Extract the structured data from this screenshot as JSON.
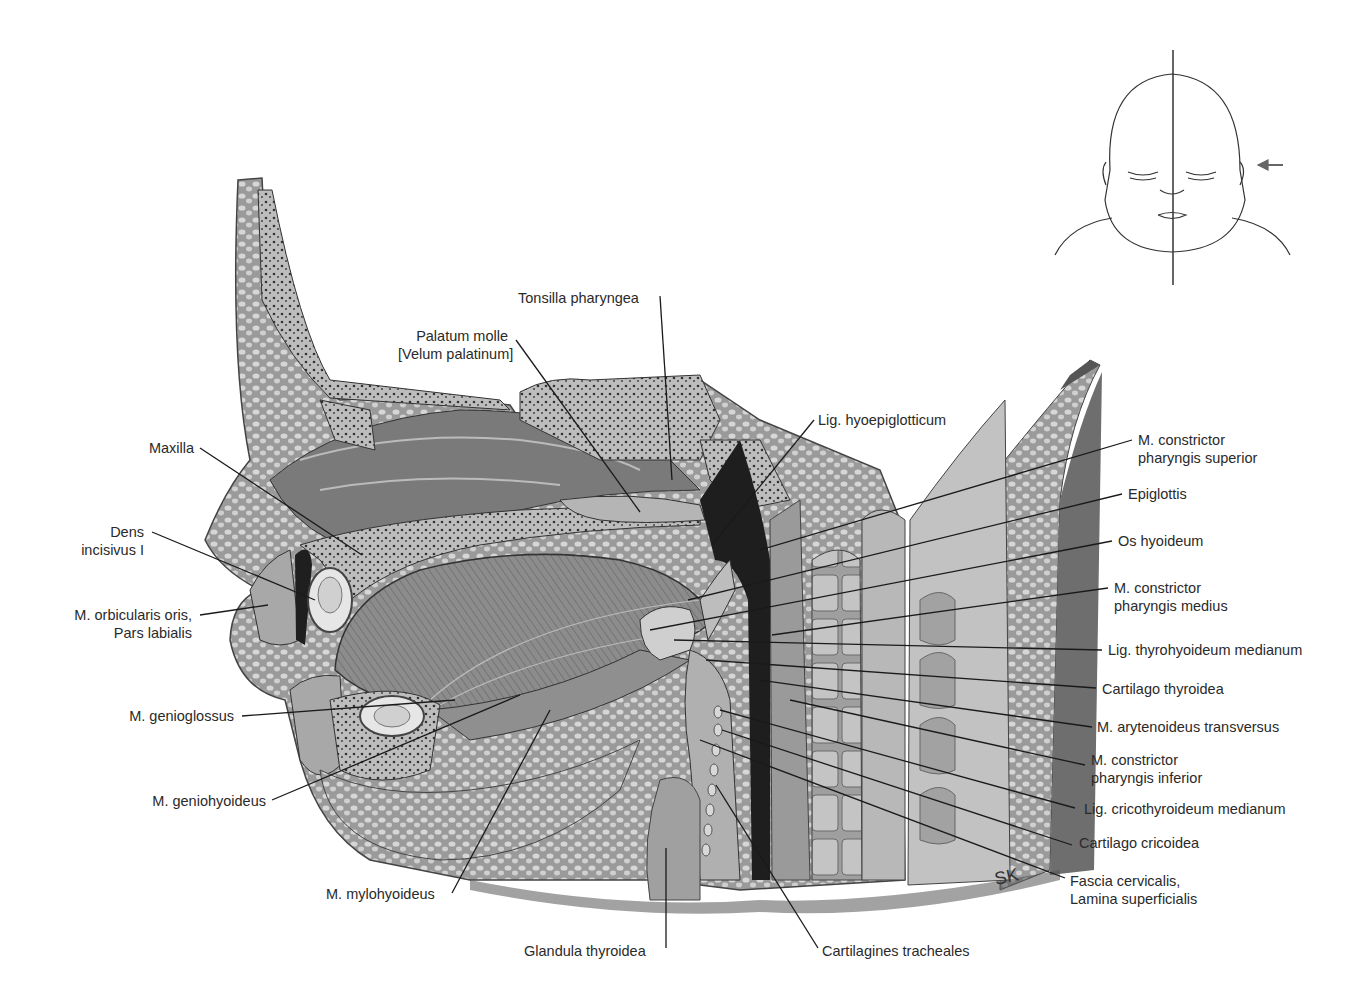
{
  "figure": {
    "signature": "SK",
    "orientation_inset": {
      "icon": "infant-face-with-midline-and-arrow"
    }
  },
  "labels": {
    "tonsilla_pharyngea": "Tonsilla pharyngea",
    "palatum_molle_1": "Palatum molle",
    "palatum_molle_2": "[Velum palatinum]",
    "lig_hyoepiglotticum": "Lig. hyoepiglotticum",
    "maxilla": "Maxilla",
    "dens_1": "Dens",
    "dens_2": "incisivus I",
    "orbicularis_1": "M. orbicularis oris,",
    "orbicularis_2": "Pars labialis",
    "genioglossus": "M. genioglossus",
    "geniohyoideus": "M. geniohyoideus",
    "mylohyoideus": "M. mylohyoideus",
    "glandula_thyroidea": "Glandula thyroidea",
    "cartilagines_tracheales": "Cartilagines tracheales",
    "constrictor_sup_1": "M. constrictor",
    "constrictor_sup_2": "pharyngis superior",
    "epiglottis": "Epiglottis",
    "os_hyoideum": "Os hyoideum",
    "constrictor_med_1": "M. constrictor",
    "constrictor_med_2": "pharyngis medius",
    "lig_thyrohyoideum": "Lig. thyrohyoideum medianum",
    "cartilago_thyroidea": "Cartilago thyroidea",
    "arytenoideus": "M. arytenoideus transversus",
    "constrictor_inf_1": "M. constrictor",
    "constrictor_inf_2": "pharyngis inferior",
    "lig_cricothyroideum": "Lig. cricothyroideum medianum",
    "cartilago_cricoidea": "Cartilago cricoidea",
    "fascia_1": "Fascia cervicalis,",
    "fascia_2": "Lamina superficialis"
  }
}
